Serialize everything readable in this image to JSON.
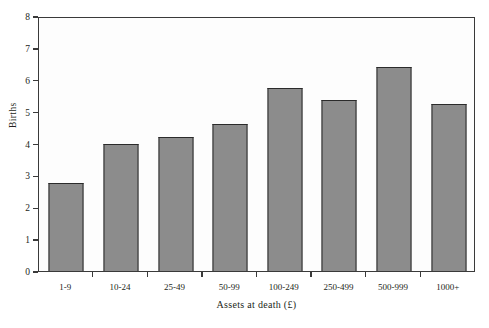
{
  "chart_data": {
    "type": "bar",
    "title": "",
    "subtitle": "",
    "xlabel": "Assets at death (£)",
    "ylabel": "Births",
    "categories": [
      "1-9",
      "10-24",
      "25-49",
      "50-99",
      "100-249",
      "250-499",
      "500-999",
      "1000+"
    ],
    "values": [
      2.75,
      4.0,
      4.2,
      4.6,
      5.75,
      5.35,
      6.4,
      5.25
    ],
    "ylim": [
      0,
      8
    ],
    "ytick_labels": [
      "0",
      "1",
      "2",
      "3",
      "4",
      "5",
      "6",
      "7",
      "8"
    ],
    "ytick_values": [
      0,
      1,
      2,
      3,
      4,
      5,
      6,
      7,
      8
    ],
    "grid": false,
    "legend": null,
    "legend_position": "none",
    "annotations": [],
    "colors": {
      "bar_fill": "#8c8c8c",
      "bar_edge": "#2b2b2b",
      "axis": "#3a3a3a",
      "text": "#231f20",
      "background": "#ffffff"
    }
  }
}
